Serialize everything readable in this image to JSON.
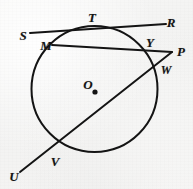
{
  "figure": {
    "kind": "circle-geometry-diagram",
    "width": 193,
    "height": 189,
    "background_color": "#f4f4f3",
    "ink_color": "#141414"
  },
  "circle": {
    "center_label": "O",
    "center_x": 94.5,
    "center_y": 89,
    "radius": 63,
    "stroke_width": 2.0
  },
  "center_dot": {
    "x": 95,
    "y": 92,
    "radius": 2.6
  },
  "points": {
    "S": {
      "label": "S",
      "x": 23,
      "y": 35
    },
    "T": {
      "label": "T",
      "x": 92,
      "y": 17
    },
    "R": {
      "label": "R",
      "x": 171,
      "y": 22
    },
    "M": {
      "label": "M",
      "x": 46,
      "y": 45
    },
    "Y": {
      "label": "Y",
      "x": 150,
      "y": 42
    },
    "P": {
      "label": "P",
      "x": 181,
      "y": 51
    },
    "W": {
      "label": "W",
      "x": 166,
      "y": 70
    },
    "O": {
      "label": "O",
      "x": 88,
      "y": 84
    },
    "V": {
      "label": "V",
      "x": 55,
      "y": 161
    },
    "U": {
      "label": "U",
      "x": 14,
      "y": 176
    }
  },
  "lines": [
    {
      "name": "tangent-line-SR",
      "from": "S",
      "to": "R",
      "x1": 30,
      "y1": 33,
      "x2": 166,
      "y2": 24,
      "tangent_at": "T"
    },
    {
      "name": "secant-line-MP",
      "from": "M",
      "to": "P",
      "x1": 52,
      "y1": 45,
      "x2": 172,
      "y2": 52,
      "through": [
        "M",
        "Y",
        "P"
      ]
    },
    {
      "name": "secant-line-UP",
      "from": "U",
      "to": "P",
      "x1": 20,
      "y1": 172,
      "x2": 172,
      "y2": 52,
      "through": [
        "U",
        "V",
        "W",
        "P"
      ]
    }
  ],
  "annotations": {
    "tangent_point": "T",
    "external_point": "P",
    "chord_MY": [
      "M",
      "Y"
    ],
    "chord_VW": [
      "V",
      "W"
    ]
  }
}
